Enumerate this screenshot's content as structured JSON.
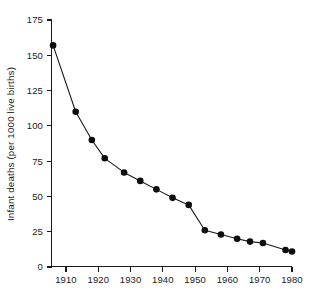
{
  "chart_data": {
    "type": "line",
    "title": "",
    "subtitle": "",
    "xlabel": "",
    "ylabel": "Infant deaths (per 1000 live births)",
    "xlim": [
      1905,
      1982
    ],
    "ylim": [
      0,
      175
    ],
    "grid": false,
    "legend": null,
    "legend_position": "none",
    "marker": "filled-circle",
    "x_ticks": [
      1910,
      1920,
      1930,
      1940,
      1950,
      1960,
      1970,
      1980
    ],
    "x_tick_labels": [
      "1910",
      "1920",
      "1930",
      "1940",
      "1950",
      "1960",
      "1970",
      "1980"
    ],
    "y_ticks": [
      0,
      25,
      50,
      75,
      100,
      125,
      150,
      175
    ],
    "y_tick_labels": [
      "0",
      "25",
      "50",
      "75",
      "100",
      "125",
      "150",
      "175"
    ],
    "x": [
      1906,
      1913,
      1918,
      1922,
      1928,
      1933,
      1938,
      1943,
      1948,
      1953,
      1958,
      1963,
      1967,
      1971,
      1978,
      1980
    ],
    "values": [
      157,
      110,
      90,
      77,
      67,
      61,
      55,
      49,
      44,
      26,
      23,
      20,
      18,
      17,
      12,
      11
    ],
    "points": [
      {
        "x": 1906,
        "y": 157
      },
      {
        "x": 1913,
        "y": 110
      },
      {
        "x": 1918,
        "y": 90
      },
      {
        "x": 1922,
        "y": 77
      },
      {
        "x": 1928,
        "y": 67
      },
      {
        "x": 1933,
        "y": 61
      },
      {
        "x": 1938,
        "y": 55
      },
      {
        "x": 1943,
        "y": 49
      },
      {
        "x": 1948,
        "y": 44
      },
      {
        "x": 1953,
        "y": 26
      },
      {
        "x": 1958,
        "y": 23
      },
      {
        "x": 1963,
        "y": 20
      },
      {
        "x": 1967,
        "y": 18
      },
      {
        "x": 1971,
        "y": 17
      },
      {
        "x": 1978,
        "y": 12
      },
      {
        "x": 1980,
        "y": 11
      }
    ],
    "colors": {
      "line": "#1a1a1a",
      "marker": "#0d0d0d",
      "axis": "#1a1a1a",
      "background": "#ffffff"
    }
  }
}
